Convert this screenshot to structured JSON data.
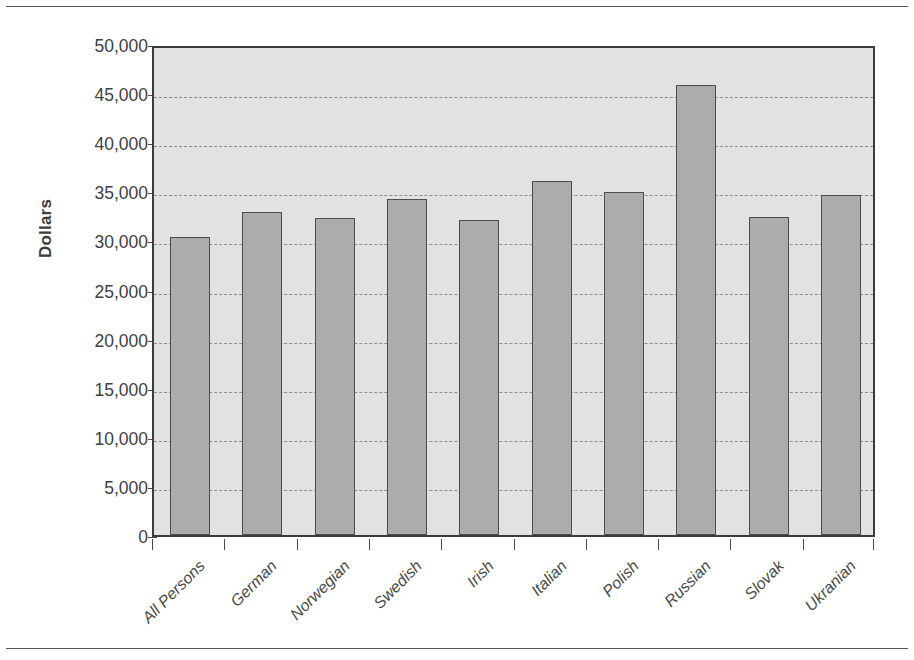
{
  "chart_data": {
    "type": "bar",
    "title": "",
    "xlabel": "",
    "ylabel": "Dollars",
    "ylim": [
      0,
      50000
    ],
    "grid": true,
    "legend": "none",
    "categories": [
      "All Persons",
      "German",
      "Norwegian",
      "Swedish",
      "Irish",
      "Italian",
      "Polish",
      "Russian",
      "Slovak",
      "Ukranian"
    ],
    "values": [
      30300,
      32900,
      32300,
      34200,
      32100,
      36100,
      34900,
      45800,
      32400,
      34600
    ],
    "y_ticks": [
      0,
      5000,
      10000,
      15000,
      20000,
      25000,
      30000,
      35000,
      40000,
      45000,
      50000
    ],
    "y_tick_labels": [
      "0",
      "5,000",
      "10,000",
      "15,000",
      "20,000",
      "25,000",
      "30,000",
      "35,000",
      "40,000",
      "45,000",
      "50,000"
    ]
  },
  "style": {
    "bar_fill": "#acacac",
    "bar_stroke": "#4d4d4d",
    "plot_background": "#e2e2e2",
    "gridline_color": "#8d8d8d",
    "axis_color": "#3b3b3b",
    "text_color": "#3f3f3f",
    "page_background": "#ffffff"
  }
}
